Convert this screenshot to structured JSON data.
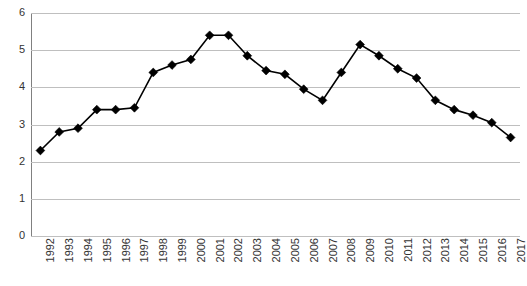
{
  "chart_data": {
    "type": "line",
    "title": "",
    "subtitle": "",
    "xlabel": "",
    "ylabel": "",
    "categories": [
      "1992",
      "1993",
      "1994",
      "1995",
      "1996",
      "1997",
      "1998",
      "1999",
      "2000",
      "2001",
      "2002",
      "2003",
      "2004",
      "2005",
      "2006",
      "2007",
      "2008",
      "2009",
      "2010",
      "2011",
      "2012",
      "2013",
      "2014",
      "2015",
      "2016",
      "2017"
    ],
    "values": [
      2.3,
      2.8,
      2.9,
      3.4,
      3.4,
      3.45,
      4.4,
      4.6,
      4.75,
      5.4,
      5.4,
      4.85,
      4.45,
      4.35,
      3.95,
      3.65,
      4.4,
      5.15,
      4.85,
      4.5,
      4.25,
      3.65,
      3.4,
      3.25,
      3.05,
      2.65
    ],
    "series": [
      {
        "name": "",
        "values": [
          2.3,
          2.8,
          2.9,
          3.4,
          3.4,
          3.45,
          4.4,
          4.6,
          4.75,
          5.4,
          5.4,
          4.85,
          4.45,
          4.35,
          3.95,
          3.65,
          4.4,
          5.15,
          4.85,
          4.5,
          4.25,
          3.65,
          3.4,
          3.25,
          3.05,
          2.65
        ],
        "marker": "diamond",
        "color": "#000000"
      }
    ],
    "ylim": [
      0,
      6
    ],
    "yticks": [
      0,
      1,
      2,
      3,
      4,
      5,
      6
    ],
    "ytick_labels": [
      "0",
      "1",
      "2",
      "3",
      "4",
      "5",
      "6"
    ],
    "grid": true,
    "grid_color": "#bfbfbf",
    "legend": false,
    "legend_position": "none",
    "axis_color": "#808080",
    "background": "#ffffff",
    "annotations": []
  },
  "axes": {
    "y": {
      "labels": [
        "6",
        "5",
        "4",
        "3",
        "2",
        "1",
        "0"
      ],
      "min": 0,
      "max": 6
    },
    "x": {
      "labels": [
        "1992",
        "1993",
        "1994",
        "1995",
        "1996",
        "1997",
        "1998",
        "1999",
        "2000",
        "2001",
        "2002",
        "2003",
        "2004",
        "2005",
        "2006",
        "2007",
        "2008",
        "2009",
        "2010",
        "2011",
        "2012",
        "2013",
        "2014",
        "2015",
        "2016",
        "2017"
      ],
      "rotation": "-90"
    }
  }
}
